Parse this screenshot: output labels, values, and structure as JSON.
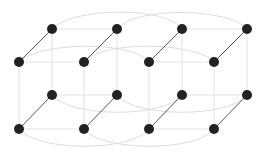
{
  "diagram": {
    "type": "3d-lattice",
    "node_color": "#222222",
    "depth_edge_color": "#555555",
    "grid_edge_color": "#e2e2e2",
    "arc_color": "#dcdcdc",
    "node_radius": 5,
    "nodes": {
      "back_top": [
        [
          52,
          29
        ],
        [
          117,
          29
        ],
        [
          182,
          29
        ],
        [
          247,
          29
        ]
      ],
      "front_top": [
        [
          19,
          62
        ],
        [
          84,
          62
        ],
        [
          149,
          62
        ],
        [
          214,
          62
        ]
      ],
      "back_bottom": [
        [
          52,
          95
        ],
        [
          117,
          95
        ],
        [
          182,
          95
        ],
        [
          247,
          95
        ]
      ],
      "front_bottom": [
        [
          19,
          129
        ],
        [
          84,
          129
        ],
        [
          149,
          129
        ],
        [
          214,
          129
        ]
      ]
    },
    "node_count": 16
  }
}
